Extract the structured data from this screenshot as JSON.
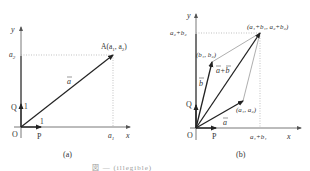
{
  "panel_a": {
    "caption": "(a)",
    "axis_x": "x",
    "axis_y": "y",
    "origin": "O",
    "point_p": "P",
    "point_q": "Q",
    "unit_x": "1",
    "unit_y": "1",
    "tick_x": "a",
    "tick_x_sub": "1",
    "tick_y": "a",
    "tick_y_sub": "2",
    "point_a_label": "A(a",
    "point_a_sub1": "1",
    "point_a_mid": ", a",
    "point_a_sub2": "2",
    "point_a_end": ")",
    "vector_label": "a"
  },
  "panel_b": {
    "caption": "(b)",
    "axis_x": "x",
    "axis_y": "y",
    "origin": "O",
    "point_p": "P",
    "point_q": "Q",
    "tick_x": "a₁+b₁",
    "tick_y": "a₂+b₂",
    "point_sum": "(a₁+b₁, a₂+b₂)",
    "point_b": "(b₁, b₂)",
    "point_a": "(a₁, a₂)",
    "vector_a": "a",
    "vector_b": "b",
    "vector_sum": "a+b"
  },
  "figure_caption": "図 — (illegible)"
}
